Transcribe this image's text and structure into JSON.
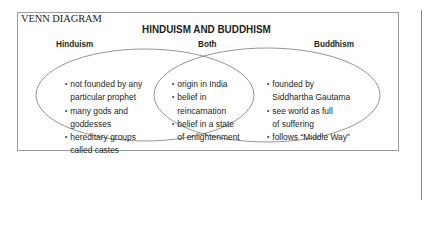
{
  "diagram": {
    "type_label": "VENN DIAGRAM",
    "title": "HINDUISM AND BUDDHISM",
    "colors": {
      "text": "#231f20",
      "frame": "#9a9a9a",
      "ellipse_stroke": "#7a7a7a"
    },
    "sets": {
      "left": {
        "label": "Hinduism",
        "items": [
          {
            "lines": [
              "not founded by any",
              "particular prophet"
            ]
          },
          {
            "lines": [
              "many gods and",
              "goddesses"
            ]
          },
          {
            "lines": [
              "hereditary groups",
              "called castes"
            ]
          }
        ]
      },
      "center": {
        "label": "Both",
        "items": [
          {
            "lines": [
              "origin in India"
            ]
          },
          {
            "lines": [
              "belief in",
              "reincarnation"
            ]
          },
          {
            "lines": [
              "belief in a state",
              "of enlightenment"
            ]
          }
        ]
      },
      "right": {
        "label": "Buddhism",
        "items": [
          {
            "lines": [
              "founded by",
              "Siddhartha Gautama"
            ]
          },
          {
            "lines": [
              "see world as full",
              "of suffering"
            ]
          },
          {
            "lines": [
              "follows “Middle Way”"
            ]
          }
        ]
      }
    },
    "bullet_glyph": "•"
  }
}
